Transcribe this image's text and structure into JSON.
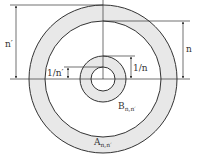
{
  "diagram": {
    "type": "concentric annuli",
    "colors": {
      "stroke": "#333333",
      "ring_fill": "#e8e8e8",
      "background": "#ffffff"
    },
    "labels": {
      "n_prime": "n′",
      "n": "n",
      "one_over_n": "1/n",
      "one_over_n_prime": "1/n′",
      "B_main": "B",
      "B_sub": "n,n′",
      "A_main": "A",
      "A_sub": "n,n′"
    },
    "regions": [
      {
        "name": "A_{n,n'}",
        "description": "outer shaded annulus"
      },
      {
        "name": "B_{n,n'}",
        "description": "inner shaded annulus"
      }
    ]
  }
}
